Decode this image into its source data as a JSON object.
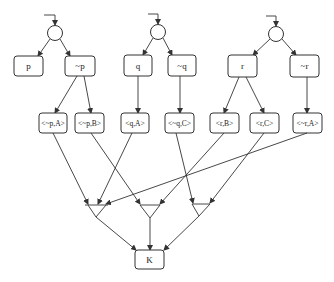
{
  "diagram": {
    "top_nodes": [
      {
        "id": "p",
        "label": "p"
      },
      {
        "id": "np",
        "label": "~p"
      },
      {
        "id": "q",
        "label": "q"
      },
      {
        "id": "nq",
        "label": "~q"
      },
      {
        "id": "r",
        "label": "r"
      },
      {
        "id": "nr",
        "label": "~r"
      }
    ],
    "mid_nodes": [
      {
        "id": "npA",
        "label": "<~p,A>"
      },
      {
        "id": "npB",
        "label": "<~p,B>"
      },
      {
        "id": "qA",
        "label": "<q,A>"
      },
      {
        "id": "nqC",
        "label": "<~q,C>"
      },
      {
        "id": "rB",
        "label": "<r,B>"
      },
      {
        "id": "rC",
        "label": "<r,C>"
      },
      {
        "id": "nrA",
        "label": "<~r,A>"
      }
    ],
    "goal_node": {
      "id": "K",
      "label": "K"
    },
    "or_nodes": [
      "or-p",
      "or-q",
      "or-r"
    ],
    "and_gates": [
      {
        "id": "and-A",
        "inputs": [
          "npA",
          "qA",
          "nrA"
        ]
      },
      {
        "id": "and-B",
        "inputs": [
          "npB",
          "rB"
        ]
      },
      {
        "id": "and-C",
        "inputs": [
          "nqC",
          "rC"
        ]
      }
    ],
    "colors": {
      "line": "#333333",
      "background": "#ffffff"
    }
  }
}
